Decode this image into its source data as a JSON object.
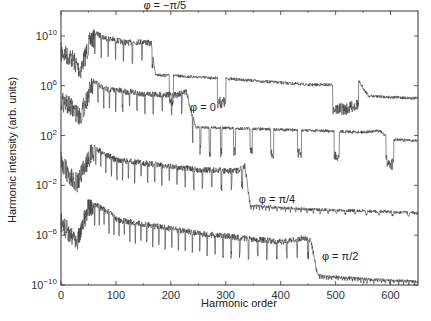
{
  "chart_data": {
    "type": "line",
    "title": "",
    "xlabel": "Harmonic order",
    "ylabel": "Harmonic intensity (arb. units)",
    "xlim": [
      0,
      650
    ],
    "ylim_log10": [
      -10,
      12
    ],
    "x_ticks": [
      0,
      100,
      200,
      300,
      400,
      500,
      600
    ],
    "x_tick_labels": [
      "0",
      "100",
      "200",
      "300",
      "400",
      "500",
      "600"
    ],
    "y_ticks_log10": [
      10,
      6,
      2,
      -2,
      -6,
      -10
    ],
    "y_tick_labels": [
      {
        "base": "10",
        "exp": "10"
      },
      {
        "base": "10",
        "exp": "6"
      },
      {
        "base": "10",
        "exp": "2"
      },
      {
        "base": "10",
        "exp": "−2"
      },
      {
        "base": "10",
        "exp": "−6"
      },
      {
        "base": "10",
        "exp": "−10"
      }
    ],
    "grid": false,
    "legend": "inline labels",
    "series": [
      {
        "name": "φ = −π/5",
        "label_pos": [
          150,
          12.2
        ],
        "cutoff": 170,
        "envelope_log10": [
          [
            0,
            9.5
          ],
          [
            20,
            9.0
          ],
          [
            35,
            8.0
          ],
          [
            55,
            10.6
          ],
          [
            80,
            10.1
          ],
          [
            120,
            9.7
          ],
          [
            150,
            9.8
          ],
          [
            165,
            9.6
          ],
          [
            172,
            7.0
          ],
          [
            300,
            6.7
          ],
          [
            450,
            6.2
          ],
          [
            520,
            6.2
          ],
          [
            540,
            6.6
          ],
          [
            560,
            5.3
          ],
          [
            650,
            5.1
          ]
        ]
      },
      {
        "name": "φ = 0",
        "label_pos": [
          235,
          4.0
        ],
        "cutoff": 240,
        "envelope_log10": [
          [
            0,
            5.6
          ],
          [
            20,
            5.0
          ],
          [
            35,
            4.3
          ],
          [
            55,
            6.7
          ],
          [
            80,
            6.0
          ],
          [
            150,
            5.6
          ],
          [
            210,
            5.5
          ],
          [
            228,
            5.8
          ],
          [
            245,
            2.8
          ],
          [
            400,
            2.6
          ],
          [
            550,
            2.4
          ],
          [
            580,
            2.5
          ],
          [
            600,
            1.8
          ],
          [
            650,
            1.7
          ]
        ]
      },
      {
        "name": "φ = π/4",
        "label_pos": [
          360,
          -3.4
        ],
        "cutoff": 345,
        "envelope_log10": [
          [
            0,
            0.8
          ],
          [
            15,
            -0.5
          ],
          [
            30,
            -1.0
          ],
          [
            55,
            1.4
          ],
          [
            100,
            0.3
          ],
          [
            250,
            -0.5
          ],
          [
            320,
            -0.6
          ],
          [
            335,
            -0.2
          ],
          [
            345,
            -3.5
          ],
          [
            450,
            -3.8
          ],
          [
            600,
            -4.0
          ],
          [
            650,
            -4.1
          ]
        ]
      },
      {
        "name": "φ = π/2",
        "label_pos": [
          475,
          -8.0
        ],
        "cutoff": 465,
        "envelope_log10": [
          [
            0,
            -4.2
          ],
          [
            15,
            -5.0
          ],
          [
            30,
            -5.5
          ],
          [
            50,
            -3.0
          ],
          [
            90,
            -4.0
          ],
          [
            100,
            -4.5
          ],
          [
            250,
            -5.6
          ],
          [
            400,
            -6.3
          ],
          [
            440,
            -6.0
          ],
          [
            455,
            -6.2
          ],
          [
            468,
            -9.1
          ],
          [
            550,
            -9.4
          ],
          [
            650,
            -9.6
          ]
        ]
      }
    ]
  }
}
